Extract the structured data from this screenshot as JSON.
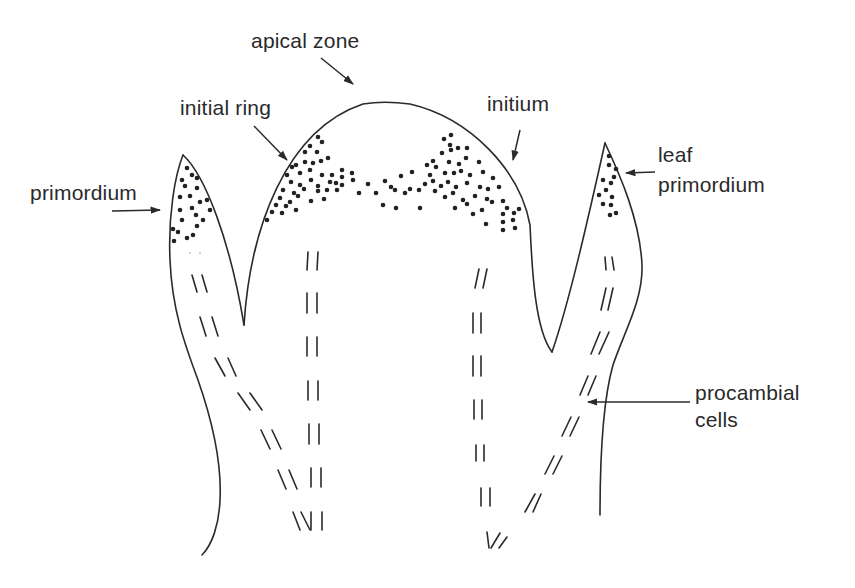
{
  "diagram": {
    "type": "biological-illustration",
    "labels": {
      "apical_zone": "apical zone",
      "initial_ring": "initial ring",
      "initium": "initium",
      "leaf_primordium_line1": "leaf",
      "leaf_primordium_line2": "primordium",
      "primordium": "primordium",
      "procambial_line1": "procambial",
      "procambial_line2": "cells"
    },
    "colors": {
      "line": "#2a2a2a",
      "background": "#ffffff"
    },
    "structures": [
      "left primordium",
      "central apical dome",
      "right leaf primordium",
      "procambial strands (dashed)"
    ]
  }
}
